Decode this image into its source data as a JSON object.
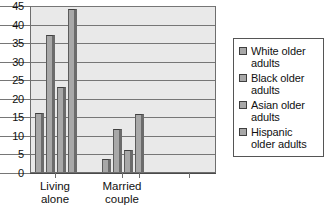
{
  "chart_data": {
    "type": "bar",
    "title": "",
    "subtitle": "",
    "xlabel": "",
    "ylabel": "",
    "categories": [
      "Living\nalone",
      "Married\ncouple"
    ],
    "series": [
      {
        "name": "White older adults",
        "values": [
          16,
          3.5
        ]
      },
      {
        "name": "Black older adults",
        "values": [
          37,
          11.5
        ]
      },
      {
        "name": "Asian older adults",
        "values": [
          23,
          6
        ]
      },
      {
        "name": "Hispanic older adults",
        "values": [
          44,
          15.5
        ]
      }
    ],
    "ylim": [
      0,
      45
    ],
    "ytick_values": [
      0,
      5,
      10,
      15,
      20,
      25,
      30,
      35,
      40,
      45
    ],
    "ytick_labels": [
      "0",
      "5",
      "10",
      "15",
      "20",
      "25",
      "30",
      "35",
      "40",
      "45"
    ],
    "grid": true,
    "legend_position": "right",
    "bar_color": "#a8a8a8",
    "plot_background": "#e9e9e9",
    "gridline_color": "#767676"
  },
  "legend": {
    "items": [
      {
        "label": "White older adults"
      },
      {
        "label": "Black older adults"
      },
      {
        "label": "Asian older adults"
      },
      {
        "label": "Hispanic older adults"
      }
    ]
  }
}
